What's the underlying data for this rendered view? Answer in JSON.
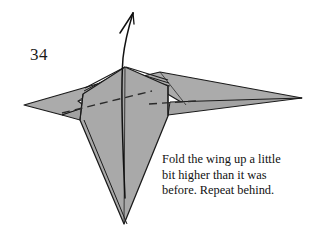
{
  "page": {
    "background_color": "#ffffff",
    "width": 323,
    "height": 238
  },
  "step": {
    "number": "34"
  },
  "caption": {
    "line1": "Fold the wing up a little",
    "line2": "bit higher than it was",
    "line3": "before. Repeat behind."
  },
  "figure": {
    "kind": "origami-model",
    "paper_fill": "#a9a9a9",
    "paper_fill_light": "#b4b4b4",
    "paper_fill_dark": "#9d9d9d",
    "outline_color": "#1a1a1a",
    "fold_line_color": "#2a2a2a",
    "fold_line_style": "dashed",
    "arrow": {
      "label": "fold-up-arrow",
      "direction": "up",
      "color": "#111111"
    },
    "parts": [
      "left-wing",
      "right-wing",
      "body",
      "apex-layers",
      "valley-fold-line-left",
      "valley-fold-line-right"
    ]
  }
}
